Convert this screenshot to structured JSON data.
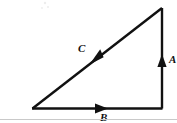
{
  "figure": {
    "background_color": "#ffffff",
    "line_color": "#111111",
    "rule_color": "#c9c9c9",
    "width": 177,
    "height": 123,
    "shape": {
      "type": "right-triangle",
      "vertices": {
        "bottom_left": [
          33,
          108
        ],
        "bottom_right": [
          162,
          108
        ],
        "top_right": [
          162,
          8
        ]
      }
    },
    "vectors": [
      {
        "id": "A",
        "label": "A",
        "label_x": 169,
        "label_y": 62,
        "direction": "up",
        "side": "vertical-right-leg",
        "line": {
          "x1": 162,
          "y1": 108,
          "x2": 162,
          "y2": 8
        },
        "arrow_tip": [
          162,
          55
        ],
        "arrow_angle_deg": 270
      },
      {
        "id": "B",
        "label": "B",
        "label_x": 104,
        "label_y": 120,
        "direction": "right",
        "side": "horizontal-base",
        "line": {
          "x1": 33,
          "y1": 108,
          "x2": 162,
          "y2": 108
        },
        "arrow_tip": [
          107,
          108
        ],
        "arrow_angle_deg": 0
      },
      {
        "id": "C",
        "label": "C",
        "label_x": 80,
        "label_y": 52,
        "direction": "down-left",
        "side": "hypotenuse",
        "line": {
          "x1": 162,
          "y1": 8,
          "x2": 33,
          "y2": 108
        },
        "arrow_tip": [
          90,
          63
        ],
        "arrow_angle_deg": 142
      }
    ],
    "baseline_rule": {
      "x1": 0,
      "y1": 119,
      "x2": 177,
      "y2": 119
    }
  }
}
